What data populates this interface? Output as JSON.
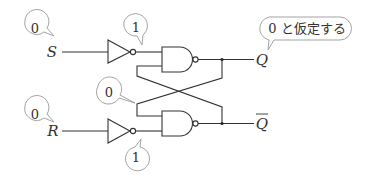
{
  "diagram": {
    "type": "SR latch (NAND) with inverted inputs",
    "inputs": {
      "s": {
        "label": "S",
        "value": "0"
      },
      "r": {
        "label": "R",
        "value": "0"
      }
    },
    "inverter_outputs": {
      "top": "1",
      "bottom": "1"
    },
    "feedback_value": "0",
    "outputs": {
      "q": {
        "label": "Q"
      },
      "q_bar": {
        "label": "Q"
      }
    },
    "assumption_note": "0 と仮定する"
  }
}
